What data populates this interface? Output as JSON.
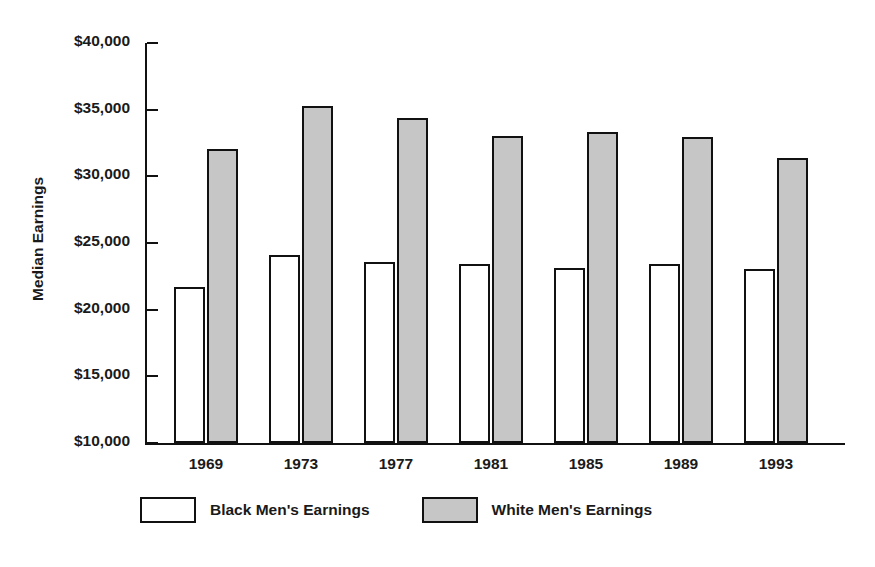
{
  "chart_data": {
    "type": "bar",
    "title": "",
    "xlabel": "",
    "ylabel": "Median Earnings",
    "categories": [
      "1969",
      "1973",
      "1977",
      "1981",
      "1985",
      "1989",
      "1993"
    ],
    "series": [
      {
        "name": "Black Men's Earnings",
        "color": "#ffffff",
        "values": [
          21700,
          24100,
          23600,
          23450,
          23100,
          23400,
          23050
        ]
      },
      {
        "name": "White Men's Earnings",
        "color": "#c6c6c6",
        "values": [
          32050,
          35250,
          34350,
          33000,
          33350,
          32950,
          31350
        ]
      }
    ],
    "ylim": [
      10000,
      40000
    ],
    "ytick_values": [
      40000,
      35000,
      30000,
      25000,
      20000,
      15000,
      10000
    ],
    "ytick_labels": [
      "$40,000",
      "$35,000",
      "$30,000",
      "$25,000",
      "$20,000",
      "$15,000",
      "$10,000"
    ],
    "grid": false,
    "legend_position": "bottom-left",
    "axis_color": "#111111",
    "background_color": "#ffffff"
  },
  "legend": {
    "entries": [
      {
        "label": "Black Men's Earnings"
      },
      {
        "label": "White Men's Earnings"
      }
    ]
  }
}
